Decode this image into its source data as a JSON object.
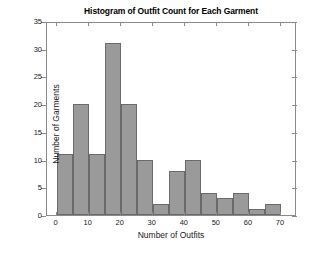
{
  "chart_data": {
    "type": "bar",
    "title": "Histogram of Outfit Count for Each Garment",
    "xlabel": "Number of Outfits",
    "ylabel": "Number of Garments",
    "xlim": [
      -3,
      75
    ],
    "ylim": [
      0,
      35
    ],
    "bin_width": 5,
    "grid": false,
    "legend": null,
    "bar_fill_color": "#9a9a9a",
    "bar_edge_color": "#6a6a6a",
    "axis_color": "#8a8a8a",
    "background_color": "#ffffff",
    "xticks": [
      0,
      10,
      20,
      30,
      40,
      50,
      60,
      70
    ],
    "xtick_labels": [
      "0",
      "10",
      "20",
      "30",
      "40",
      "50",
      "60",
      "70"
    ],
    "yticks": [
      0,
      5,
      10,
      15,
      20,
      25,
      30,
      35
    ],
    "ytick_labels": [
      "0",
      "5",
      "10",
      "15",
      "20",
      "25",
      "30",
      "35"
    ],
    "bins": [
      {
        "x0": 0,
        "x1": 5,
        "value": 11
      },
      {
        "x0": 5,
        "x1": 10,
        "value": 20
      },
      {
        "x0": 10,
        "x1": 15,
        "value": 11
      },
      {
        "x0": 15,
        "x1": 20,
        "value": 31
      },
      {
        "x0": 20,
        "x1": 25,
        "value": 20
      },
      {
        "x0": 25,
        "x1": 30,
        "value": 10
      },
      {
        "x0": 30,
        "x1": 35,
        "value": 2
      },
      {
        "x0": 35,
        "x1": 40,
        "value": 8
      },
      {
        "x0": 40,
        "x1": 45,
        "value": 10
      },
      {
        "x0": 45,
        "x1": 50,
        "value": 4
      },
      {
        "x0": 50,
        "x1": 55,
        "value": 3
      },
      {
        "x0": 55,
        "x1": 60,
        "value": 4
      },
      {
        "x0": 60,
        "x1": 65,
        "value": 1
      },
      {
        "x0": 65,
        "x1": 70,
        "value": 2
      }
    ],
    "categories": [
      "0-5",
      "5-10",
      "10-15",
      "15-20",
      "20-25",
      "25-30",
      "30-35",
      "35-40",
      "40-45",
      "45-50",
      "50-55",
      "55-60",
      "60-65",
      "65-70"
    ],
    "values": [
      11,
      20,
      11,
      31,
      20,
      10,
      2,
      8,
      10,
      4,
      3,
      4,
      1,
      2
    ]
  }
}
